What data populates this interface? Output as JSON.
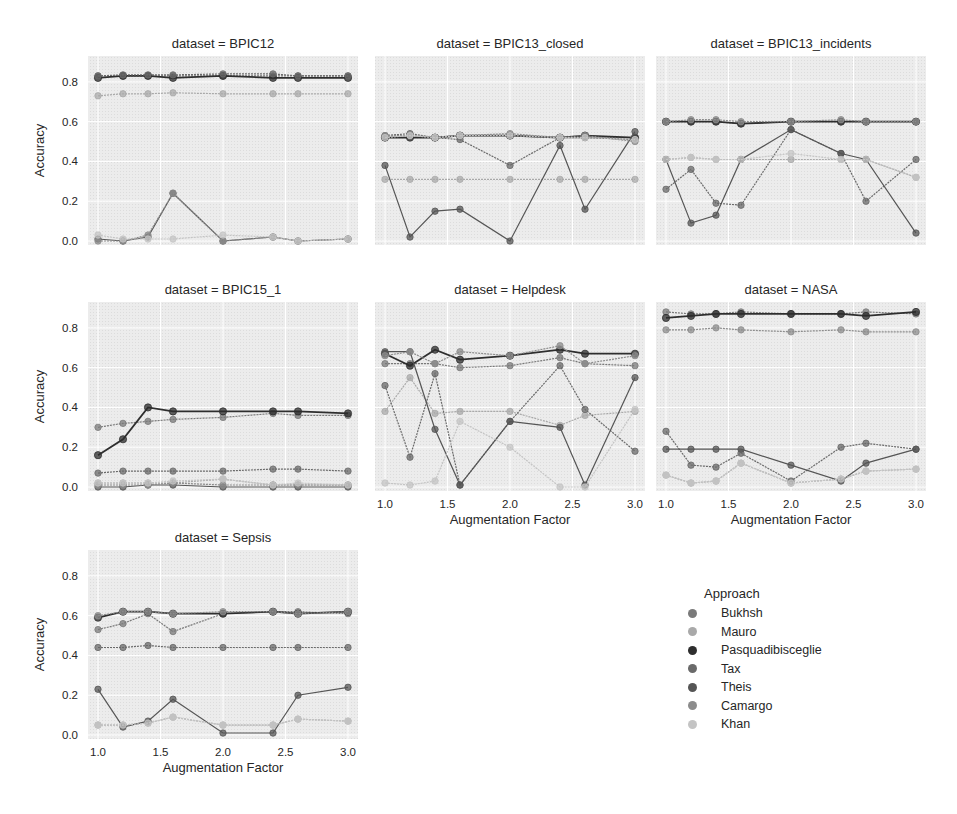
{
  "chart_data": {
    "type": "line",
    "layout": "facet grid 3x3 (7 panels)",
    "xlabel": "Augmentation Factor",
    "ylabel": "Accuracy",
    "x": [
      1.0,
      1.2,
      1.4,
      1.6,
      2.0,
      2.4,
      2.6,
      3.0
    ],
    "xticks": [
      "1.0",
      "1.5",
      "2.0",
      "2.5",
      "3.0"
    ],
    "yticks": [
      "0.0",
      "0.2",
      "0.4",
      "0.6",
      "0.8"
    ],
    "ylim": [
      -0.02,
      0.93
    ],
    "xlim": [
      0.92,
      3.08
    ],
    "grid": true,
    "legend": {
      "title": "Approach",
      "position": "lower right",
      "entries": [
        "Bukhsh",
        "Mauro",
        "Pasquadibisceglie",
        "Tax",
        "Theis",
        "Camargo",
        "Khan"
      ]
    },
    "series_colors": {
      "Bukhsh": "#7a7a7a",
      "Mauro": "#a9a9a9",
      "Pasquadibisceglie": "#2e2e2e",
      "Tax": "#6a6a6a",
      "Theis": "#555555",
      "Camargo": "#8c8c8c",
      "Khan": "#c4c4c4"
    },
    "panels": [
      {
        "title": "dataset = BPIC12",
        "series": [
          {
            "name": "Bukhsh",
            "values": [
              0.83,
              0.83,
              0.83,
              0.83,
              0.83,
              0.83,
              0.83,
              0.83
            ]
          },
          {
            "name": "Mauro",
            "values": [
              0.73,
              0.74,
              0.74,
              0.745,
              0.74,
              0.74,
              0.74,
              0.74
            ]
          },
          {
            "name": "Pasquadibisceglie",
            "values": [
              0.82,
              0.83,
              0.83,
              0.82,
              0.83,
              0.82,
              0.82,
              0.82
            ]
          },
          {
            "name": "Tax",
            "values": [
              0.83,
              0.835,
              0.835,
              0.835,
              0.84,
              0.84,
              0.83,
              0.83
            ]
          },
          {
            "name": "Theis",
            "values": [
              0.01,
              0.0,
              0.02,
              0.24,
              0.0,
              0.02,
              0.0,
              0.01
            ]
          },
          {
            "name": "Camargo",
            "values": [
              0.0,
              0.0,
              0.03,
              0.24,
              0.0,
              0.02,
              0.0,
              0.01
            ]
          },
          {
            "name": "Khan",
            "values": [
              0.03,
              0.01,
              0.01,
              0.01,
              0.03,
              0.02,
              0.0,
              0.01
            ]
          }
        ]
      },
      {
        "title": "dataset = BPIC13_closed",
        "series": [
          {
            "name": "Bukhsh",
            "values": [
              0.52,
              0.53,
              0.52,
              0.53,
              0.53,
              0.52,
              0.52,
              0.52
            ]
          },
          {
            "name": "Mauro",
            "values": [
              0.31,
              0.31,
              0.31,
              0.31,
              0.31,
              0.31,
              0.31,
              0.31
            ]
          },
          {
            "name": "Pasquadibisceglie",
            "values": [
              0.52,
              0.52,
              0.52,
              0.53,
              0.53,
              0.52,
              0.53,
              0.52
            ]
          },
          {
            "name": "Tax",
            "values": [
              0.53,
              0.54,
              0.52,
              0.51,
              0.38,
              0.52,
              0.52,
              0.51
            ]
          },
          {
            "name": "Theis",
            "values": [
              0.38,
              0.02,
              0.15,
              0.16,
              0.0,
              0.48,
              0.16,
              0.55
            ]
          },
          {
            "name": "Camargo",
            "values": [
              0.53,
              0.53,
              0.52,
              0.53,
              0.54,
              0.52,
              0.53,
              0.5
            ]
          },
          {
            "name": "Khan",
            "values": [
              0.52,
              0.53,
              0.52,
              0.53,
              0.53,
              0.52,
              0.52,
              0.51
            ]
          }
        ]
      },
      {
        "title": "dataset = BPIC13_incidents",
        "series": [
          {
            "name": "Bukhsh",
            "values": [
              0.6,
              0.6,
              0.6,
              0.59,
              0.6,
              0.6,
              0.6,
              0.6
            ]
          },
          {
            "name": "Mauro",
            "values": [
              0.41,
              0.42,
              0.41,
              0.41,
              0.41,
              0.41,
              0.41,
              0.32
            ]
          },
          {
            "name": "Pasquadibisceglie",
            "values": [
              0.6,
              0.6,
              0.6,
              0.59,
              0.6,
              0.6,
              0.6,
              0.6
            ]
          },
          {
            "name": "Tax",
            "values": [
              0.26,
              0.36,
              0.19,
              0.18,
              0.56,
              0.44,
              0.2,
              0.41
            ]
          },
          {
            "name": "Theis",
            "values": [
              0.41,
              0.09,
              0.13,
              0.41,
              0.56,
              0.44,
              0.41,
              0.04
            ]
          },
          {
            "name": "Camargo",
            "values": [
              0.6,
              0.61,
              0.61,
              0.6,
              0.6,
              0.61,
              0.6,
              0.6
            ]
          },
          {
            "name": "Khan",
            "values": [
              0.41,
              0.42,
              0.41,
              0.41,
              0.44,
              0.41,
              0.41,
              0.32
            ]
          }
        ]
      },
      {
        "title": "dataset = BPIC15_1",
        "series": [
          {
            "name": "Bukhsh",
            "values": [
              0.3,
              0.32,
              0.33,
              0.34,
              0.35,
              0.37,
              0.36,
              0.36
            ]
          },
          {
            "name": "Mauro",
            "values": [
              0.02,
              0.02,
              0.02,
              0.02,
              0.04,
              0.01,
              0.01,
              0.01
            ]
          },
          {
            "name": "Pasquadibisceglie",
            "values": [
              0.16,
              0.24,
              0.4,
              0.38,
              0.38,
              0.38,
              0.38,
              0.37
            ]
          },
          {
            "name": "Tax",
            "values": [
              0.07,
              0.08,
              0.08,
              0.08,
              0.08,
              0.09,
              0.09,
              0.08
            ]
          },
          {
            "name": "Theis",
            "values": [
              0.0,
              0.0,
              0.01,
              0.01,
              0.0,
              0.0,
              0.0,
              0.0
            ]
          },
          {
            "name": "Camargo",
            "values": [
              0.01,
              0.01,
              0.01,
              0.02,
              0.01,
              0.01,
              0.01,
              0.01
            ]
          },
          {
            "name": "Khan",
            "values": [
              0.02,
              0.02,
              0.02,
              0.03,
              0.04,
              0.01,
              0.02,
              0.01
            ]
          }
        ]
      },
      {
        "title": "dataset = Helpdesk",
        "series": [
          {
            "name": "Bukhsh",
            "values": [
              0.62,
              0.62,
              0.62,
              0.6,
              0.61,
              0.65,
              0.62,
              0.61
            ]
          },
          {
            "name": "Mauro",
            "values": [
              0.38,
              0.55,
              0.37,
              0.38,
              0.38,
              0.31,
              0.36,
              0.38
            ]
          },
          {
            "name": "Pasquadibisceglie",
            "values": [
              0.67,
              0.61,
              0.69,
              0.64,
              0.66,
              0.69,
              0.67,
              0.67
            ]
          },
          {
            "name": "Tax",
            "values": [
              0.51,
              0.15,
              0.57,
              0.01,
              0.33,
              0.61,
              0.39,
              0.18
            ]
          },
          {
            "name": "Theis",
            "values": [
              0.68,
              0.68,
              0.29,
              0.01,
              0.33,
              0.3,
              0.01,
              0.55
            ]
          },
          {
            "name": "Camargo",
            "values": [
              0.66,
              0.68,
              0.62,
              0.68,
              0.66,
              0.71,
              0.62,
              0.66
            ]
          },
          {
            "name": "Khan",
            "values": [
              0.02,
              0.01,
              0.03,
              0.33,
              0.2,
              0.0,
              0.0,
              0.39
            ]
          }
        ]
      },
      {
        "title": "dataset = NASA",
        "series": [
          {
            "name": "Bukhsh",
            "values": [
              0.88,
              0.87,
              0.87,
              0.88,
              0.87,
              0.87,
              0.88,
              0.87
            ]
          },
          {
            "name": "Mauro",
            "values": [
              0.06,
              0.02,
              0.03,
              0.12,
              0.02,
              0.04,
              0.08,
              0.09
            ]
          },
          {
            "name": "Pasquadibisceglie",
            "values": [
              0.85,
              0.86,
              0.87,
              0.87,
              0.87,
              0.87,
              0.86,
              0.88
            ]
          },
          {
            "name": "Tax",
            "values": [
              0.28,
              0.11,
              0.1,
              0.17,
              0.03,
              0.2,
              0.22,
              0.19
            ]
          },
          {
            "name": "Theis",
            "values": [
              0.19,
              0.19,
              0.19,
              0.19,
              0.11,
              0.03,
              0.12,
              0.19
            ]
          },
          {
            "name": "Camargo",
            "values": [
              0.79,
              0.79,
              0.8,
              0.79,
              0.78,
              0.79,
              0.78,
              0.78
            ]
          },
          {
            "name": "Khan",
            "values": [
              0.06,
              0.02,
              0.03,
              0.12,
              0.02,
              0.04,
              0.08,
              0.09
            ]
          }
        ]
      },
      {
        "title": "dataset = Sepsis",
        "series": [
          {
            "name": "Bukhsh",
            "values": [
              0.53,
              0.56,
              0.61,
              0.52,
              0.61,
              0.62,
              0.62,
              0.61
            ]
          },
          {
            "name": "Mauro",
            "values": [
              0.05,
              0.05,
              0.06,
              0.09,
              0.05,
              0.05,
              0.08,
              0.07
            ]
          },
          {
            "name": "Pasquadibisceglie",
            "values": [
              0.59,
              0.62,
              0.62,
              0.61,
              0.61,
              0.62,
              0.61,
              0.62
            ]
          },
          {
            "name": "Tax",
            "values": [
              0.44,
              0.44,
              0.45,
              0.44,
              0.44,
              0.44,
              0.44,
              0.44
            ]
          },
          {
            "name": "Theis",
            "values": [
              0.23,
              0.04,
              0.07,
              0.18,
              0.01,
              0.01,
              0.2,
              0.24
            ]
          },
          {
            "name": "Camargo",
            "values": [
              0.6,
              0.62,
              0.62,
              0.61,
              0.62,
              0.62,
              0.61,
              0.62
            ]
          },
          {
            "name": "Khan",
            "values": [
              0.05,
              0.05,
              0.06,
              0.09,
              0.05,
              0.05,
              0.08,
              0.07
            ]
          }
        ]
      }
    ]
  },
  "legend": {
    "title": "Approach",
    "items": [
      "Bukhsh",
      "Mauro",
      "Pasquadibisceglie",
      "Tax",
      "Theis",
      "Camargo",
      "Khan"
    ]
  }
}
